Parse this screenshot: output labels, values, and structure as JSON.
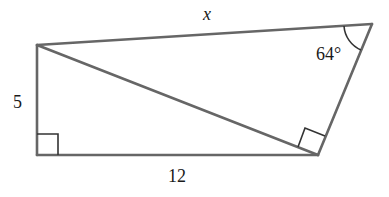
{
  "diagram": {
    "type": "geometry-figure",
    "vertices": {
      "A": {
        "x": 37,
        "y": 45
      },
      "B": {
        "x": 37,
        "y": 155
      },
      "C": {
        "x": 318,
        "y": 155
      },
      "D": {
        "x": 372,
        "y": 24
      }
    },
    "labels": {
      "top_side": "x",
      "left_side": "5",
      "bottom_side": "12",
      "angle": "64°"
    },
    "right_angles": [
      "B",
      "C (between diagonal AC and side CD)"
    ],
    "colors": {
      "edge": "#666666",
      "text": "#1a1a1a",
      "background": "#ffffff"
    }
  }
}
